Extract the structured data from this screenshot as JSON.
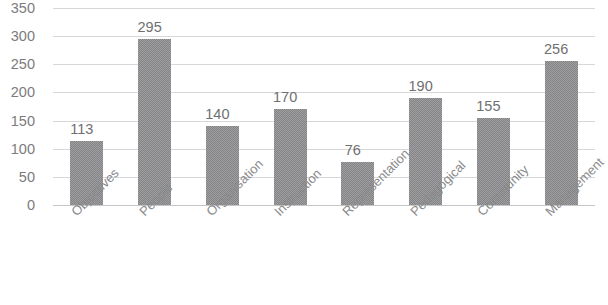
{
  "chart_data": {
    "type": "bar",
    "title": "",
    "xlabel": "",
    "ylabel": "",
    "categories": [
      "Objectives",
      "People",
      "Organisation",
      "Instruction",
      "Representation",
      "Pedagogical",
      "Community",
      "Management"
    ],
    "values": [
      113,
      295,
      140,
      170,
      76,
      190,
      155,
      256
    ],
    "data_labels": [
      "113",
      "295",
      "140",
      "170",
      "76",
      "190",
      "155",
      "256"
    ],
    "ylim": [
      0,
      350
    ],
    "yticks": [
      350,
      300,
      250,
      200,
      150,
      100,
      50,
      0
    ],
    "ytick_labels": [
      "350",
      "300",
      "250",
      "200",
      "150",
      "100",
      "50",
      "0"
    ],
    "grid": true,
    "legend": false,
    "legend_position": "none",
    "series_name": "",
    "bar_color": "#848486",
    "gridline_color": "#d5d7d9",
    "text_color": "#7b7b7d",
    "category_label_rotation": -45
  },
  "clipped_title": ""
}
